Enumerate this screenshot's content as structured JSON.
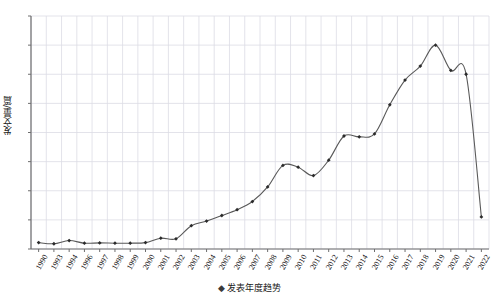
{
  "chart_data": {
    "type": "line",
    "title": "",
    "xlabel": "",
    "ylabel": "发文量/篇",
    "legend": [
      {
        "name": "发表年度趋势",
        "marker": "diamond-marker"
      }
    ],
    "legend_position": "bottom-center",
    "grid": true,
    "ylim": [
      0,
      800
    ],
    "yticks": [
      0,
      100,
      200,
      300,
      400,
      500,
      600,
      700,
      800
    ],
    "categories": [
      "1990",
      "1993",
      "1994",
      "1996",
      "1997",
      "1998",
      "1999",
      "2000",
      "2001",
      "2002",
      "2003",
      "2004",
      "2005",
      "2006",
      "2007",
      "2008",
      "2009",
      "2010",
      "2011",
      "2012",
      "2013",
      "2014",
      "2015",
      "2016",
      "2017",
      "2018",
      "2019",
      "2020",
      "2021",
      "2022"
    ],
    "xtick_labels": [
      "1990",
      "1993",
      "1994",
      "1996",
      "1997",
      "1998",
      "1999",
      "2000",
      "2001",
      "2002",
      "2003",
      "2004",
      "2005",
      "2006",
      "2007",
      "2008",
      "2009",
      "2010",
      "2011",
      "2012",
      "2013",
      "2014",
      "2015",
      "2016",
      "2017",
      "2018",
      "2019",
      "2020",
      "2021",
      "2022"
    ],
    "series": [
      {
        "name": "发表年度趋势",
        "values": [
          22,
          18,
          29,
          20,
          21,
          20,
          20,
          22,
          37,
          35,
          80,
          96,
          115,
          135,
          163,
          213,
          287,
          281,
          252,
          305,
          388,
          385,
          395,
          495,
          580,
          628,
          700,
          613,
          600,
          110
        ]
      }
    ]
  },
  "colors": {
    "line": "#595959",
    "marker": "#2b2b2b",
    "grid": "#dcdce4",
    "axis": "#8a8a8a",
    "text": "#111111",
    "background": "#ffffff"
  }
}
